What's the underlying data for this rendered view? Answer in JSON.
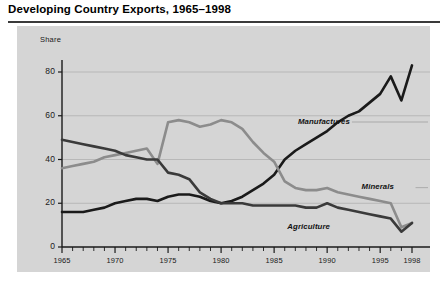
{
  "title": "Developing Country Exports, 1965–1998",
  "chart_data": {
    "type": "line",
    "title": "Developing Country Exports, 1965–1998",
    "xlabel": "",
    "ylabel": "Share",
    "ylim": [
      0,
      90
    ],
    "xlim": [
      1965,
      1998
    ],
    "yticks": [
      0,
      20,
      40,
      60,
      80
    ],
    "xticks": [
      1965,
      1970,
      1975,
      1980,
      1985,
      1990,
      1995,
      1998
    ],
    "minor_xticks_every": 1,
    "grid": "horizontal",
    "legend": "inline-labels",
    "x": [
      1965,
      1966,
      1967,
      1968,
      1969,
      1970,
      1971,
      1972,
      1973,
      1974,
      1975,
      1976,
      1977,
      1978,
      1979,
      1980,
      1981,
      1982,
      1983,
      1984,
      1985,
      1986,
      1987,
      1988,
      1989,
      1990,
      1991,
      1992,
      1993,
      1994,
      1995,
      1996,
      1997,
      1998
    ],
    "series": [
      {
        "name": "Manufactures",
        "color": "#1a1a1a",
        "values": [
          16,
          16,
          16,
          17,
          18,
          20,
          21,
          22,
          22,
          21,
          23,
          24,
          24,
          23,
          21,
          20,
          21,
          23,
          26,
          29,
          33,
          40,
          44,
          47,
          50,
          53,
          57,
          60,
          62,
          66,
          70,
          78,
          67,
          83
        ]
      },
      {
        "name": "Minerals",
        "color": "#8c8c8c",
        "values": [
          36,
          37,
          38,
          39,
          41,
          42,
          43,
          44,
          45,
          38,
          57,
          58,
          57,
          55,
          56,
          58,
          57,
          54,
          48,
          43,
          39,
          30,
          27,
          26,
          26,
          27,
          25,
          24,
          23,
          22,
          21,
          20,
          9,
          11
        ]
      },
      {
        "name": "Agriculture",
        "color": "#3a3a3a",
        "values": [
          49,
          48,
          47,
          46,
          45,
          44,
          42,
          41,
          40,
          40,
          34,
          33,
          31,
          25,
          22,
          20,
          20,
          20,
          19,
          19,
          19,
          19,
          19,
          18,
          18,
          20,
          18,
          17,
          16,
          15,
          14,
          13,
          7,
          11
        ]
      }
    ],
    "annotations": [
      {
        "text": "Manufactures",
        "x": 1988,
        "y": 56
      },
      {
        "text": "Minerals",
        "x": 1994,
        "y": 26
      },
      {
        "text": "Agriculture",
        "x": 1987,
        "y": 8
      }
    ],
    "colors": {
      "panel_background": "#d5d5d5",
      "page_background": "#ffffff",
      "axis": "#1a1a1a",
      "gridline": "#b0b0b0",
      "manufactures": "#1a1a1a",
      "minerals": "#8c8c8c",
      "agriculture": "#3a3a3a"
    }
  },
  "axis": {
    "y_title": "Share",
    "y_ticks": [
      "0",
      "20",
      "40",
      "60",
      "80"
    ],
    "x_ticks": [
      "1965",
      "1970",
      "1975",
      "1980",
      "1985",
      "1990",
      "1995",
      "1998"
    ]
  },
  "labels": {
    "manufactures": "Manufactures",
    "minerals": "Minerals",
    "agriculture": "Agriculture"
  }
}
